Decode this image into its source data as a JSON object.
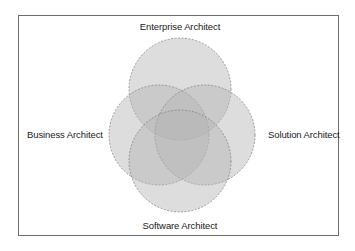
{
  "diagram": {
    "type": "venn",
    "sets": [
      {
        "id": "enterprise",
        "label": "Enterprise Architect",
        "position": "top"
      },
      {
        "id": "business",
        "label": "Business Architect",
        "position": "left"
      },
      {
        "id": "solution",
        "label": "Solution Architect",
        "position": "right"
      },
      {
        "id": "software",
        "label": "Software Architect",
        "position": "bottom"
      }
    ],
    "colors": {
      "circle_fill": "#b4b4b4",
      "circle_stroke": "#7a7a7a",
      "frame_border": "#6e6e6e",
      "text": "#1a1a1a"
    }
  }
}
